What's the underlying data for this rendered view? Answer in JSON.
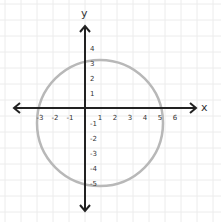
{
  "chart_data": {
    "type": "scatter",
    "title": "",
    "xlabel": "x",
    "ylabel": "y",
    "x_ticks": [
      -3,
      -2,
      -1,
      1,
      2,
      3,
      4,
      5,
      6
    ],
    "y_ticks": [
      4,
      3,
      2,
      1,
      -1,
      -2,
      -3,
      -4,
      -5
    ],
    "xlim": [
      -3.5,
      7.5
    ],
    "ylim": [
      -6,
      5
    ],
    "grid": true,
    "shapes": [
      {
        "type": "circle",
        "center": [
          1,
          -1
        ],
        "radius": 4.2,
        "color": "#b8b8b8"
      }
    ]
  },
  "colors": {
    "grid": "#ececec",
    "axis": "#222222",
    "curve": "#b8b8b8",
    "label": "#333333"
  },
  "labels": {
    "x_axis": "x",
    "y_axis": "y"
  }
}
